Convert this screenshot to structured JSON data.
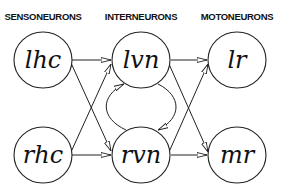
{
  "columns": {
    "sensory": "SENSONEURONS",
    "inter": "INTERNEURONS",
    "motor": "MOTONEURONS"
  },
  "nodes": {
    "lhc": "lhc",
    "rhc": "rhc",
    "lvn": "lvn",
    "rvn": "rvn",
    "lr": "lr",
    "mr": "mr"
  },
  "edges": [
    {
      "from": "lhc",
      "to": "lvn"
    },
    {
      "from": "lhc",
      "to": "rvn"
    },
    {
      "from": "rhc",
      "to": "lvn"
    },
    {
      "from": "rhc",
      "to": "rvn"
    },
    {
      "from": "lvn",
      "to": "rvn"
    },
    {
      "from": "rvn",
      "to": "lvn"
    },
    {
      "from": "lvn",
      "to": "lr"
    },
    {
      "from": "lvn",
      "to": "mr"
    },
    {
      "from": "rvn",
      "to": "lr"
    },
    {
      "from": "rvn",
      "to": "mr"
    }
  ],
  "colors": {
    "stroke": "#222222",
    "background": "#ffffff"
  }
}
